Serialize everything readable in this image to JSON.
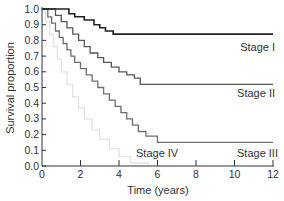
{
  "chart_data": {
    "type": "line",
    "subtype": "step (Kaplan-Meier survival curves)",
    "title": "",
    "xlabel": "Time (years)",
    "ylabel": "Survival proportion",
    "xlim": [
      0,
      12
    ],
    "ylim": [
      0.0,
      1.0
    ],
    "xticks": [
      0,
      2,
      4,
      6,
      8,
      10,
      12
    ],
    "yticks": [
      0.0,
      0.1,
      0.2,
      0.3,
      0.4,
      0.5,
      0.6,
      0.7,
      0.8,
      0.9,
      1.0
    ],
    "xtick_labels": [
      "0",
      "2",
      "4",
      "6",
      "8",
      "10",
      "12"
    ],
    "ytick_labels": [
      "0.0",
      "0.1",
      "0.2",
      "0.3",
      "0.4",
      "0.5",
      "0.6",
      "0.7",
      "0.8",
      "0.9",
      "1.0"
    ],
    "grid": false,
    "legend": "inline labels near curve ends",
    "series": [
      {
        "name": "Stage I",
        "color": "#222222",
        "label_pos": [
          10.6,
          0.75
        ],
        "steps": [
          [
            0,
            1.0
          ],
          [
            1.4,
            1.0
          ],
          [
            1.4,
            0.97
          ],
          [
            1.7,
            0.97
          ],
          [
            1.7,
            0.95
          ],
          [
            2.2,
            0.95
          ],
          [
            2.2,
            0.93
          ],
          [
            2.7,
            0.93
          ],
          [
            2.7,
            0.9
          ],
          [
            3.0,
            0.9
          ],
          [
            3.0,
            0.88
          ],
          [
            3.3,
            0.88
          ],
          [
            3.3,
            0.86
          ],
          [
            3.7,
            0.86
          ],
          [
            3.7,
            0.84
          ],
          [
            12,
            0.84
          ]
        ]
      },
      {
        "name": "Stage II",
        "color": "#555555",
        "label_pos": [
          10.6,
          0.46
        ],
        "steps": [
          [
            0,
            1.0
          ],
          [
            0.7,
            1.0
          ],
          [
            0.7,
            0.96
          ],
          [
            1.0,
            0.96
          ],
          [
            1.0,
            0.92
          ],
          [
            1.3,
            0.92
          ],
          [
            1.3,
            0.88
          ],
          [
            1.6,
            0.88
          ],
          [
            1.6,
            0.84
          ],
          [
            1.9,
            0.84
          ],
          [
            1.9,
            0.8
          ],
          [
            2.2,
            0.8
          ],
          [
            2.2,
            0.76
          ],
          [
            2.5,
            0.76
          ],
          [
            2.5,
            0.72
          ],
          [
            2.9,
            0.72
          ],
          [
            2.9,
            0.69
          ],
          [
            3.2,
            0.69
          ],
          [
            3.2,
            0.66
          ],
          [
            3.6,
            0.66
          ],
          [
            3.6,
            0.63
          ],
          [
            4.0,
            0.63
          ],
          [
            4.0,
            0.6
          ],
          [
            4.4,
            0.6
          ],
          [
            4.4,
            0.58
          ],
          [
            4.8,
            0.58
          ],
          [
            4.8,
            0.56
          ],
          [
            5.1,
            0.56
          ],
          [
            5.1,
            0.52
          ],
          [
            12,
            0.52
          ]
        ]
      },
      {
        "name": "Stage III",
        "color": "#6e6e6e",
        "label_pos": [
          10.4,
          0.1
        ],
        "steps": [
          [
            0,
            1.0
          ],
          [
            0.3,
            1.0
          ],
          [
            0.3,
            0.95
          ],
          [
            0.5,
            0.95
          ],
          [
            0.5,
            0.91
          ],
          [
            0.7,
            0.91
          ],
          [
            0.7,
            0.86
          ],
          [
            0.9,
            0.86
          ],
          [
            0.9,
            0.82
          ],
          [
            1.1,
            0.82
          ],
          [
            1.1,
            0.78
          ],
          [
            1.3,
            0.78
          ],
          [
            1.3,
            0.74
          ],
          [
            1.5,
            0.74
          ],
          [
            1.5,
            0.7
          ],
          [
            1.7,
            0.7
          ],
          [
            1.7,
            0.66
          ],
          [
            2.0,
            0.66
          ],
          [
            2.0,
            0.62
          ],
          [
            2.3,
            0.62
          ],
          [
            2.3,
            0.58
          ],
          [
            2.6,
            0.58
          ],
          [
            2.6,
            0.54
          ],
          [
            2.9,
            0.54
          ],
          [
            2.9,
            0.5
          ],
          [
            3.2,
            0.5
          ],
          [
            3.2,
            0.46
          ],
          [
            3.5,
            0.46
          ],
          [
            3.5,
            0.42
          ],
          [
            3.8,
            0.42
          ],
          [
            3.8,
            0.38
          ],
          [
            4.1,
            0.38
          ],
          [
            4.1,
            0.34
          ],
          [
            4.4,
            0.34
          ],
          [
            4.4,
            0.3
          ],
          [
            4.7,
            0.3
          ],
          [
            4.7,
            0.26
          ],
          [
            5.0,
            0.26
          ],
          [
            5.0,
            0.22
          ],
          [
            5.4,
            0.22
          ],
          [
            5.4,
            0.19
          ],
          [
            6.0,
            0.19
          ],
          [
            6.0,
            0.15
          ],
          [
            12,
            0.15
          ]
        ]
      },
      {
        "name": "Stage IV",
        "color": "#e2e2e2",
        "label_pos": [
          4.8,
          0.06
        ],
        "steps": [
          [
            0,
            1.0
          ],
          [
            0.2,
            1.0
          ],
          [
            0.2,
            0.92
          ],
          [
            0.4,
            0.92
          ],
          [
            0.4,
            0.84
          ],
          [
            0.6,
            0.84
          ],
          [
            0.6,
            0.76
          ],
          [
            0.8,
            0.76
          ],
          [
            0.8,
            0.68
          ],
          [
            1.0,
            0.68
          ],
          [
            1.0,
            0.6
          ],
          [
            1.3,
            0.6
          ],
          [
            1.3,
            0.52
          ],
          [
            1.6,
            0.52
          ],
          [
            1.6,
            0.44
          ],
          [
            1.9,
            0.44
          ],
          [
            1.9,
            0.37
          ],
          [
            2.2,
            0.37
          ],
          [
            2.2,
            0.3
          ],
          [
            2.6,
            0.3
          ],
          [
            2.6,
            0.23
          ],
          [
            3.0,
            0.23
          ],
          [
            3.0,
            0.17
          ],
          [
            3.5,
            0.17
          ],
          [
            3.5,
            0.11
          ],
          [
            4.0,
            0.11
          ],
          [
            4.0,
            0.06
          ],
          [
            4.6,
            0.06
          ],
          [
            4.6,
            0.02
          ],
          [
            5.5,
            0.02
          ],
          [
            5.5,
            0.0
          ]
        ]
      }
    ]
  },
  "labels": {
    "x_axis_title": "Time (years)",
    "y_axis_title": "Survival proportion",
    "stage_i": "Stage I",
    "stage_ii": "Stage II",
    "stage_iii": "Stage III",
    "stage_iv": "Stage IV"
  }
}
